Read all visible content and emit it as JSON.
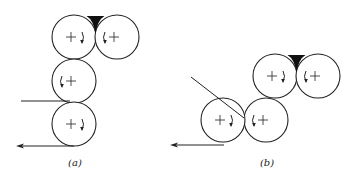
{
  "diagram": {
    "type": "roller-arrangement",
    "colors": {
      "stroke": "#222222",
      "fill": "#ffffff",
      "nip": "#111111"
    },
    "panels": [
      {
        "label": "(a)",
        "rollers": [
          {
            "id": "a-top-left",
            "cx": 74,
            "cy": 37,
            "r": 22,
            "rotation": "clockwise"
          },
          {
            "id": "a-top-right",
            "cx": 117,
            "cy": 37,
            "r": 22,
            "rotation": "counterclockwise"
          },
          {
            "id": "a-middle",
            "cx": 74,
            "cy": 81,
            "r": 22,
            "rotation": "counterclockwise"
          },
          {
            "id": "a-bottom",
            "cx": 74,
            "cy": 124,
            "r": 22,
            "rotation": "clockwise"
          }
        ],
        "input_line": {
          "x1": 21,
          "y1": 101,
          "x2": 70,
          "y2": 101
        },
        "output_arrow": {
          "x1": 74,
          "y1": 146,
          "x2": 16,
          "y2": 146
        }
      },
      {
        "label": "(b)",
        "rollers": [
          {
            "id": "b-top-left",
            "cx": 275,
            "cy": 76,
            "r": 22,
            "rotation": "clockwise"
          },
          {
            "id": "b-top-right",
            "cx": 318,
            "cy": 76,
            "r": 22,
            "rotation": "counterclockwise"
          },
          {
            "id": "b-bottom-right",
            "cx": 266,
            "cy": 120,
            "r": 22,
            "rotation": "counterclockwise"
          },
          {
            "id": "b-bottom-left",
            "cx": 223,
            "cy": 120,
            "r": 22,
            "rotation": "clockwise"
          }
        ],
        "input_line": {
          "x1": 191,
          "y1": 77,
          "x2": 244,
          "y2": 118
        },
        "output_arrow": {
          "x1": 224,
          "y1": 145,
          "x2": 170,
          "y2": 145
        }
      }
    ]
  }
}
